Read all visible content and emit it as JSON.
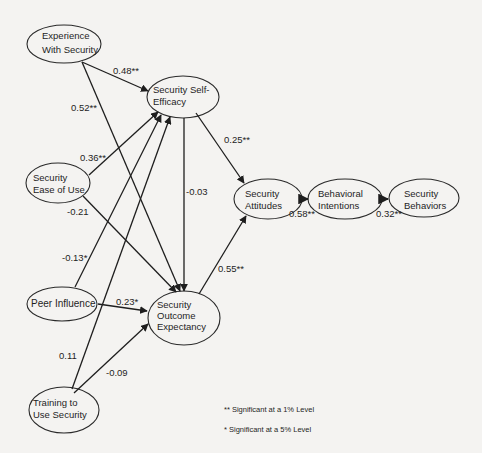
{
  "nodes": [
    {
      "id": "experience",
      "lines": [
        "Experience",
        "With Security"
      ]
    },
    {
      "id": "self_efficacy",
      "lines": [
        "Security Self-",
        "Efficacy"
      ]
    },
    {
      "id": "ease_of_use",
      "lines": [
        "Security",
        "Ease of Use"
      ]
    },
    {
      "id": "attitudes",
      "lines": [
        "Security",
        "Attitudes"
      ]
    },
    {
      "id": "intentions",
      "lines": [
        "Behavioral",
        "Intentions"
      ]
    },
    {
      "id": "behaviors",
      "lines": [
        "Security",
        "Behaviors"
      ]
    },
    {
      "id": "peer",
      "lines": [
        "Peer Influence"
      ]
    },
    {
      "id": "outcome",
      "lines": [
        "Security",
        "Outcome",
        "Expectancy"
      ]
    },
    {
      "id": "training",
      "lines": [
        "Training to",
        "Use Security"
      ]
    }
  ],
  "edges": [
    {
      "from": "experience",
      "to": "self_efficacy",
      "label": "0.48**"
    },
    {
      "from": "experience",
      "to": "outcome",
      "label": "0.52**"
    },
    {
      "from": "ease_of_use",
      "to": "self_efficacy",
      "label": "0.36**"
    },
    {
      "from": "ease_of_use",
      "to": "outcome",
      "label": "-0.21"
    },
    {
      "from": "peer",
      "to": "self_efficacy",
      "label": "-0.13*"
    },
    {
      "from": "peer",
      "to": "outcome",
      "label": "0.23*"
    },
    {
      "from": "training",
      "to": "self_efficacy",
      "label": "0.11"
    },
    {
      "from": "training",
      "to": "outcome",
      "label": "-0.09"
    },
    {
      "from": "self_efficacy",
      "to": "attitudes",
      "label": "0.25**"
    },
    {
      "from": "self_efficacy",
      "to": "outcome",
      "label": "-0.03"
    },
    {
      "from": "outcome",
      "to": "attitudes",
      "label": "0.55**"
    },
    {
      "from": "attitudes",
      "to": "intentions",
      "label": "0.58**"
    },
    {
      "from": "intentions",
      "to": "behaviors",
      "label": "0.32**"
    }
  ],
  "legend": {
    "one_percent": "** Significant at a 1% Level",
    "five_percent": "* Significant at a 5% Level"
  },
  "colors": {
    "background": "#f4f3f1",
    "ink": "#1e1e1e"
  }
}
